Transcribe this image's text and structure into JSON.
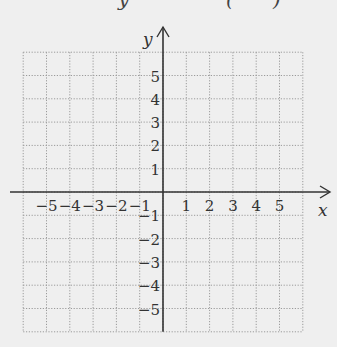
{
  "heading": {
    "partial_glyphs": [
      "y",
      "(",
      ")"
    ]
  },
  "chart_data": {
    "type": "scatter",
    "title": "",
    "xlabel": "x",
    "ylabel": "y",
    "xlim": [
      -6,
      6
    ],
    "ylim": [
      -6,
      6
    ],
    "grid": true,
    "grid_style": "dotted",
    "x_ticks": [
      -5,
      -4,
      -3,
      -2,
      -1,
      1,
      2,
      3,
      4,
      5
    ],
    "y_ticks": [
      5,
      4,
      3,
      2,
      1,
      -1,
      -2,
      -3,
      -4,
      -5
    ],
    "x_tick_labels": [
      "−5",
      "−4",
      "−3",
      "−2",
      "−1",
      "1",
      "2",
      "3",
      "4",
      "5"
    ],
    "y_tick_labels": [
      "5",
      "4",
      "3",
      "2",
      "1",
      "−1",
      "−2",
      "−3",
      "−4",
      "−5"
    ],
    "points": [],
    "series": [],
    "legend": null
  },
  "colors": {
    "background": "#efefef",
    "grid": "#9a9a9a",
    "axis": "#333333",
    "label": "#333333"
  }
}
